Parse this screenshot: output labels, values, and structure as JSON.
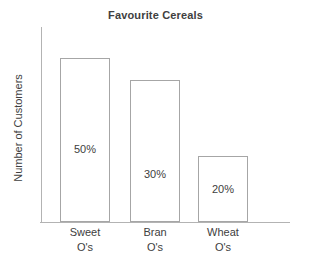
{
  "chart_data": {
    "type": "bar",
    "title": "Favourite Cereals",
    "xlabel": "",
    "ylabel": "Number of Customers",
    "categories": [
      "Sweet O's",
      "Bran O's",
      "Wheat O's"
    ],
    "category_lines": [
      [
        "Sweet",
        "O's"
      ],
      [
        "Bran",
        "O's"
      ],
      [
        "Wheat",
        "O's"
      ]
    ],
    "values": [
      50,
      30,
      20
    ],
    "value_labels": [
      "50%",
      "30%",
      "20%"
    ],
    "bar_heights_pct": [
      84,
      73,
      34
    ],
    "ylim": [
      0,
      60
    ],
    "grid": false,
    "legend": false,
    "y_tick_labels": [],
    "x_tick_labels": [
      "Sweet O's",
      "Bran O's",
      "Wheat O's"
    ]
  },
  "style": {
    "bar_fill": "#ffffff",
    "bar_stroke": "#a6a6a6",
    "axis_color": "#b3b3b3",
    "text_color": "#404040",
    "background": "#ffffff"
  }
}
